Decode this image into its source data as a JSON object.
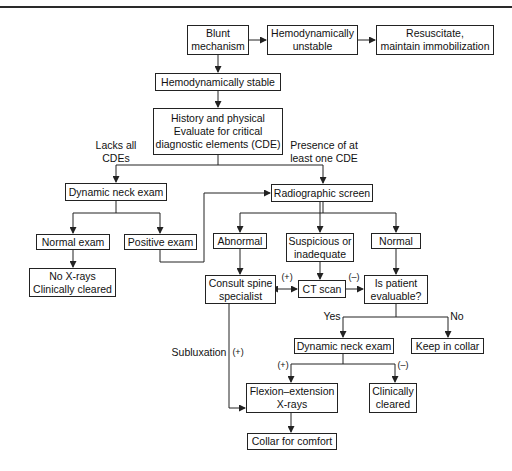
{
  "nodes": {
    "blunt": "Blunt\nmechanism",
    "unstable": "Hemodynamically\nunstable",
    "resuscitate": "Resuscitate,\nmaintain immobilization",
    "stable": "Hemodynamically stable",
    "history": "History and physical\nEvaluate for critical\ndiagnostic elements (CDE)",
    "dyn_exam_1": "Dynamic neck exam",
    "normal_exam": "Normal exam",
    "positive_exam": "Positive exam",
    "no_xrays": "No X-rays\nClinically cleared",
    "radiographic": "Radiographic screen",
    "abnormal": "Abnormal",
    "suspicious": "Suspicious or\ninadequate",
    "normal": "Normal",
    "consult": "Consult spine\nspecialist",
    "ct_scan": "CT scan",
    "evaluable": "Is patient\nevaluable?",
    "dyn_exam_2": "Dynamic neck exam",
    "keep_collar": "Keep in collar",
    "flexion": "Flexion–extension\nX-rays",
    "clin_cleared": "Clinically\ncleared",
    "collar_comfort": "Collar for comfort"
  },
  "edge_labels": {
    "lacks_all": "Lacks all\nCDEs",
    "presence": "Presence of at\nleast one CDE",
    "ct_pos": "(+)",
    "ct_neg": "(–)",
    "yes": "Yes",
    "no": "No",
    "subluxation": "Subluxation",
    "sub_pos": "(+)",
    "dyn_pos": "(+)",
    "dyn_neg": "(–)"
  },
  "colors": {
    "line": "#222222",
    "background": "#ffffff"
  }
}
